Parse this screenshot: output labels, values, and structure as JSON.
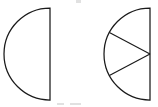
{
  "figure": {
    "background_color": "#ffffff",
    "stroke_color": "#1a1a1a",
    "shape_count": 2,
    "canvas": {
      "width": 158,
      "height": 107
    }
  },
  "shapes": [
    {
      "id": "left-semicircle",
      "label": "Undivided half circle",
      "kind": "semicircle",
      "orientation": "flat-edge-right",
      "center_x": 50,
      "center_y": 54,
      "radius": 46,
      "parts": 1,
      "shaded_parts": 0,
      "fraction": "1/1",
      "divider_angles_deg": []
    },
    {
      "id": "right-semicircle",
      "label": "Half circle divided into three sectors",
      "kind": "semicircle",
      "orientation": "flat-edge-right",
      "center_x": 150,
      "center_y": 54,
      "radius": 46,
      "parts": 3,
      "shaded_parts": 0,
      "fraction": "3/3",
      "divider_angles_deg": [
        28,
        -28
      ]
    }
  ],
  "artifacts": [
    {
      "id": "top-crop-mark",
      "x": 76,
      "y": 0,
      "width": 5,
      "height": 3
    },
    {
      "id": "bottom-crop-mark-left",
      "x": 57,
      "y": 103,
      "width": 7,
      "height": 2
    },
    {
      "id": "bottom-crop-mark-right",
      "x": 70,
      "y": 103,
      "width": 11,
      "height": 2
    }
  ]
}
